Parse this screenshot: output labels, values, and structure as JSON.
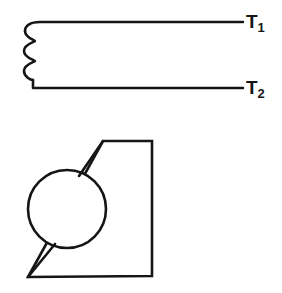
{
  "figure": {
    "background_color": "#ffffff",
    "line_color": "#151515",
    "upper_diagram": {
      "name": "coil-winding-symbol",
      "description": "Two parallel horizontal leads joined at the left by three loops of winding",
      "loop_count": 3,
      "terminals": [
        {
          "id": "T1",
          "letter": "T",
          "subscript": "1"
        },
        {
          "id": "T2",
          "letter": "T",
          "subscript": "2"
        }
      ]
    },
    "lower_diagram": {
      "name": "bracket-outline-with-hole",
      "description": "Chamfered quadrilateral plate outline overlapping a circular hole on the left side",
      "circle": {
        "label": "hole",
        "center_x": 67,
        "center_y": 209,
        "radius": 39
      },
      "polygon_points": "103,141 152,141 152,276 28,277 103,141"
    }
  }
}
